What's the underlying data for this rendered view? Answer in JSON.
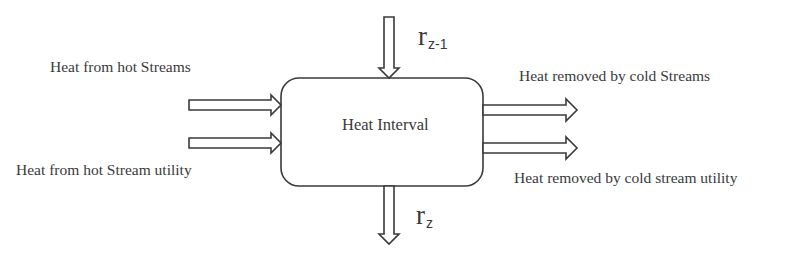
{
  "diagram": {
    "type": "flow-diagram",
    "center_node": {
      "label": "Heat Interval"
    },
    "inputs": [
      {
        "label": "Heat from hot Streams",
        "direction": "in-left"
      },
      {
        "label": "Heat from hot Stream utility",
        "direction": "in-left"
      }
    ],
    "outputs": [
      {
        "label": "Heat removed by cold Streams",
        "direction": "out-right"
      },
      {
        "label": "Heat removed by cold stream utility",
        "direction": "out-right"
      }
    ],
    "residual_in": {
      "symbol": "r",
      "subscript": "z-1",
      "direction": "in-top"
    },
    "residual_out": {
      "symbol": "r",
      "subscript": "z",
      "direction": "out-bottom"
    },
    "colors": {
      "stroke": "#3a3a3a",
      "text": "#3a3a3a",
      "background": "#ffffff"
    }
  }
}
